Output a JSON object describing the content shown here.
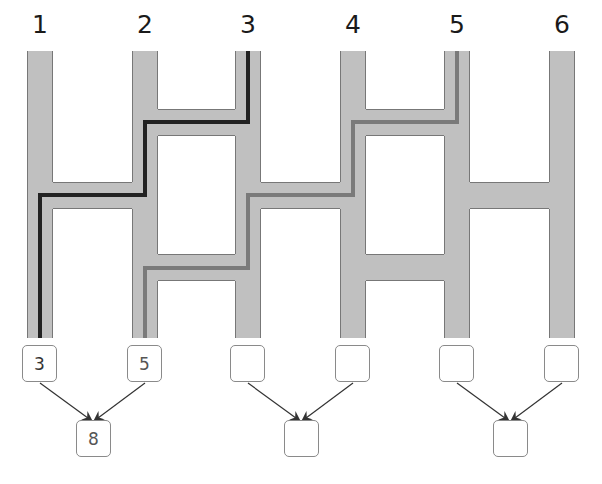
{
  "ladder": {
    "columns": [
      {
        "label": "1",
        "x": 27
      },
      {
        "label": "2",
        "x": 132
      },
      {
        "label": "3",
        "x": 235
      },
      {
        "label": "4",
        "x": 340
      },
      {
        "label": "5",
        "x": 444
      },
      {
        "label": "6",
        "x": 549
      }
    ],
    "column_width": 26,
    "top_y": 51,
    "bottom_y": 338,
    "rungs": [
      {
        "from": 2,
        "to": 3,
        "y": 109
      },
      {
        "from": 4,
        "to": 5,
        "y": 109
      },
      {
        "from": 1,
        "to": 2,
        "y": 182
      },
      {
        "from": 3,
        "to": 4,
        "y": 182
      },
      {
        "from": 5,
        "to": 6,
        "y": 182
      },
      {
        "from": 2,
        "to": 3,
        "y": 254
      },
      {
        "from": 4,
        "to": 5,
        "y": 254
      }
    ],
    "rung_height": 27,
    "colors": {
      "rail_fill": "#c0c0c0",
      "rail_edge": "#777777",
      "path_dark": "#222222",
      "path_gray": "#7a7a7a"
    },
    "traced_paths": [
      {
        "start_column": "3",
        "end_column": "1",
        "color": "#222222"
      },
      {
        "start_column": "5",
        "end_column": "2",
        "color": "#7a7a7a"
      }
    ]
  },
  "answer_boxes": {
    "top_row": [
      "3",
      "5",
      "",
      "",
      "",
      ""
    ],
    "sums": [
      "8",
      "",
      ""
    ]
  }
}
